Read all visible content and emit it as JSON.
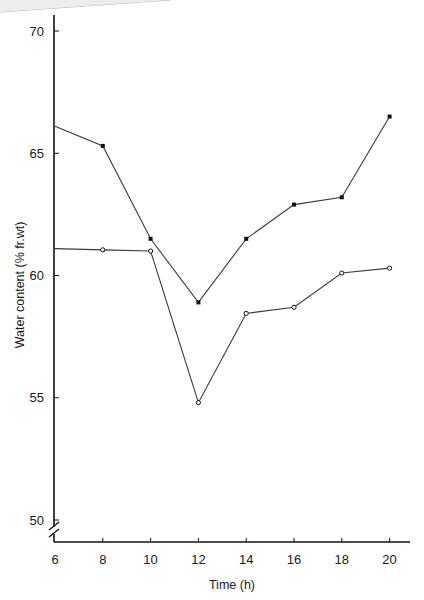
{
  "chart_data": {
    "type": "line",
    "title": "",
    "xlabel": "Time (h)",
    "ylabel": "Water content (% fr.wt)",
    "x": [
      6,
      8,
      10,
      12,
      14,
      16,
      18,
      20
    ],
    "xticks": [
      6,
      8,
      10,
      12,
      14,
      16,
      18,
      20
    ],
    "yticks": [
      50,
      55,
      60,
      65,
      70
    ],
    "xlim": [
      6,
      21
    ],
    "ylim": [
      49,
      71
    ],
    "y_axis_break": true,
    "grid": false,
    "legend": null,
    "series": [
      {
        "name": "filled-marker series",
        "marker": "filled-square",
        "values": [
          66.1,
          65.3,
          61.5,
          58.9,
          61.5,
          62.9,
          63.2,
          66.5
        ]
      },
      {
        "name": "open-marker series",
        "marker": "open-circle",
        "values": [
          61.1,
          61.05,
          61.0,
          54.8,
          58.45,
          58.7,
          60.1,
          60.3
        ]
      }
    ]
  },
  "colors": {
    "line": "#3a3a3a",
    "axis": "#111111",
    "marker_fill": "#111111",
    "background": "#ffffff",
    "page_edge": "#b0b0b0"
  }
}
